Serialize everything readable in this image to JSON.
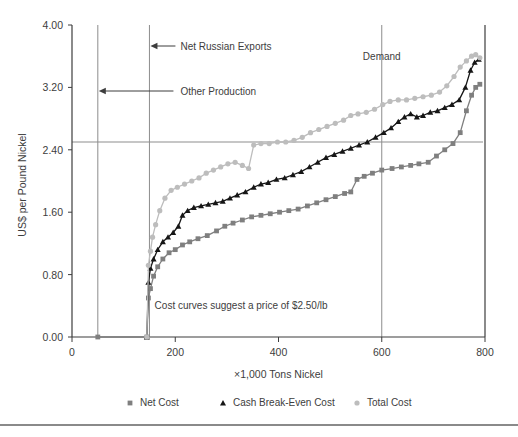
{
  "figure": {
    "background_color": "#ffffff",
    "axis_color": "#3d3d3d",
    "guide_color": "#8d8d8d"
  },
  "axes": {
    "y_title": "US$ per Pound Nickel",
    "x_title": "×1,000 Tons Nickel",
    "y_ticks": [
      "0.00",
      "0.80",
      "1.60",
      "2.40",
      "3.20",
      "4.00"
    ],
    "x_ticks": [
      "0",
      "200",
      "400",
      "600",
      "800"
    ]
  },
  "annotations": {
    "net_russian_exports": "Net Russian Exports",
    "other_production": "Other Production",
    "demand": "Demand",
    "price_note": "Cost curves suggest a price of $2.50/lb"
  },
  "legend": {
    "items": [
      {
        "label": "Net Cost",
        "marker": "square",
        "color": "#7f7f7f"
      },
      {
        "label": "Cash Break-Even Cost",
        "marker": "triangle",
        "color": "#161616"
      },
      {
        "label": "Total Cost",
        "marker": "circle",
        "color": "#bdbdbd"
      }
    ]
  },
  "chart_data": {
    "type": "line",
    "title": "",
    "xlabel": "×1,000 Tons Nickel",
    "ylabel": "US$ per Pound Nickel",
    "xlim": [
      0,
      800
    ],
    "ylim": [
      0,
      4.0
    ],
    "ytick_values": [
      0.0,
      0.8,
      1.6,
      2.4,
      3.2,
      4.0
    ],
    "xtick_values": [
      0,
      200,
      400,
      600,
      800
    ],
    "grid": false,
    "legend_position": "below",
    "reference_lines": [
      {
        "name": "net-russian-exports",
        "orientation": "vertical",
        "x": 150,
        "label": "Net Russian Exports"
      },
      {
        "name": "other-production",
        "orientation": "vertical",
        "x": 50,
        "label": "Other Production"
      },
      {
        "name": "demand",
        "orientation": "vertical",
        "x": 600,
        "label": "Demand"
      },
      {
        "name": "price-level",
        "orientation": "horizontal",
        "y": 2.5,
        "label": "Cost curves suggest a price of $2.50/lb"
      }
    ],
    "series": [
      {
        "name": "Net Cost",
        "marker": "square",
        "color": "#7f7f7f",
        "points": [
          [
            50,
            0.0
          ],
          [
            145,
            0.0
          ],
          [
            148,
            0.5
          ],
          [
            152,
            0.62
          ],
          [
            158,
            0.78
          ],
          [
            166,
            0.9
          ],
          [
            176,
            1.0
          ],
          [
            188,
            1.08
          ],
          [
            200,
            1.12
          ],
          [
            214,
            1.18
          ],
          [
            228,
            1.22
          ],
          [
            244,
            1.26
          ],
          [
            262,
            1.3
          ],
          [
            280,
            1.36
          ],
          [
            296,
            1.42
          ],
          [
            312,
            1.46
          ],
          [
            330,
            1.5
          ],
          [
            348,
            1.54
          ],
          [
            366,
            1.56
          ],
          [
            384,
            1.58
          ],
          [
            402,
            1.6
          ],
          [
            420,
            1.62
          ],
          [
            438,
            1.64
          ],
          [
            456,
            1.68
          ],
          [
            474,
            1.72
          ],
          [
            492,
            1.76
          ],
          [
            510,
            1.8
          ],
          [
            528,
            1.84
          ],
          [
            540,
            1.86
          ],
          [
            552,
            2.02
          ],
          [
            566,
            2.06
          ],
          [
            582,
            2.1
          ],
          [
            600,
            2.14
          ],
          [
            620,
            2.16
          ],
          [
            638,
            2.18
          ],
          [
            656,
            2.2
          ],
          [
            672,
            2.22
          ],
          [
            690,
            2.24
          ],
          [
            706,
            2.32
          ],
          [
            722,
            2.4
          ],
          [
            738,
            2.48
          ],
          [
            752,
            2.62
          ],
          [
            764,
            2.9
          ],
          [
            774,
            3.1
          ],
          [
            782,
            3.2
          ],
          [
            790,
            3.24
          ]
        ]
      },
      {
        "name": "Cash Break-Even Cost",
        "marker": "triangle",
        "color": "#161616",
        "points": [
          [
            145,
            0.0
          ],
          [
            148,
            0.7
          ],
          [
            152,
            0.88
          ],
          [
            158,
            1.0
          ],
          [
            166,
            1.12
          ],
          [
            176,
            1.22
          ],
          [
            186,
            1.28
          ],
          [
            196,
            1.34
          ],
          [
            206,
            1.42
          ],
          [
            214,
            1.56
          ],
          [
            224,
            1.62
          ],
          [
            236,
            1.66
          ],
          [
            250,
            1.68
          ],
          [
            264,
            1.7
          ],
          [
            278,
            1.72
          ],
          [
            292,
            1.74
          ],
          [
            306,
            1.78
          ],
          [
            320,
            1.82
          ],
          [
            336,
            1.86
          ],
          [
            352,
            1.92
          ],
          [
            366,
            1.96
          ],
          [
            380,
            1.98
          ],
          [
            396,
            2.02
          ],
          [
            412,
            2.04
          ],
          [
            428,
            2.08
          ],
          [
            444,
            2.12
          ],
          [
            460,
            2.18
          ],
          [
            476,
            2.24
          ],
          [
            492,
            2.3
          ],
          [
            508,
            2.34
          ],
          [
            524,
            2.38
          ],
          [
            540,
            2.42
          ],
          [
            556,
            2.46
          ],
          [
            572,
            2.5
          ],
          [
            588,
            2.56
          ],
          [
            604,
            2.62
          ],
          [
            618,
            2.68
          ],
          [
            632,
            2.76
          ],
          [
            644,
            2.82
          ],
          [
            656,
            2.86
          ],
          [
            668,
            2.82
          ],
          [
            680,
            2.84
          ],
          [
            694,
            2.88
          ],
          [
            708,
            2.9
          ],
          [
            722,
            2.94
          ],
          [
            736,
            2.98
          ],
          [
            750,
            3.04
          ],
          [
            762,
            3.2
          ],
          [
            772,
            3.42
          ],
          [
            780,
            3.52
          ],
          [
            788,
            3.56
          ]
        ]
      },
      {
        "name": "Total Cost",
        "marker": "circle",
        "color": "#bdbdbd",
        "points": [
          [
            145,
            0.0
          ],
          [
            148,
            0.92
          ],
          [
            152,
            1.1
          ],
          [
            156,
            1.28
          ],
          [
            162,
            1.44
          ],
          [
            170,
            1.62
          ],
          [
            180,
            1.78
          ],
          [
            192,
            1.88
          ],
          [
            204,
            1.92
          ],
          [
            218,
            1.96
          ],
          [
            232,
            2.0
          ],
          [
            246,
            2.04
          ],
          [
            260,
            2.1
          ],
          [
            274,
            2.14
          ],
          [
            288,
            2.18
          ],
          [
            302,
            2.22
          ],
          [
            316,
            2.24
          ],
          [
            330,
            2.2
          ],
          [
            342,
            2.16
          ],
          [
            352,
            2.46
          ],
          [
            366,
            2.48
          ],
          [
            382,
            2.48
          ],
          [
            398,
            2.5
          ],
          [
            414,
            2.5
          ],
          [
            430,
            2.52
          ],
          [
            446,
            2.56
          ],
          [
            462,
            2.62
          ],
          [
            478,
            2.66
          ],
          [
            494,
            2.7
          ],
          [
            510,
            2.74
          ],
          [
            526,
            2.78
          ],
          [
            540,
            2.84
          ],
          [
            554,
            2.86
          ],
          [
            570,
            2.88
          ],
          [
            586,
            2.92
          ],
          [
            602,
            2.98
          ],
          [
            616,
            3.02
          ],
          [
            632,
            3.04
          ],
          [
            648,
            3.04
          ],
          [
            664,
            3.06
          ],
          [
            680,
            3.08
          ],
          [
            696,
            3.1
          ],
          [
            712,
            3.14
          ],
          [
            726,
            3.22
          ],
          [
            740,
            3.34
          ],
          [
            752,
            3.46
          ],
          [
            764,
            3.54
          ],
          [
            774,
            3.6
          ],
          [
            782,
            3.62
          ],
          [
            790,
            3.58
          ]
        ]
      }
    ]
  }
}
